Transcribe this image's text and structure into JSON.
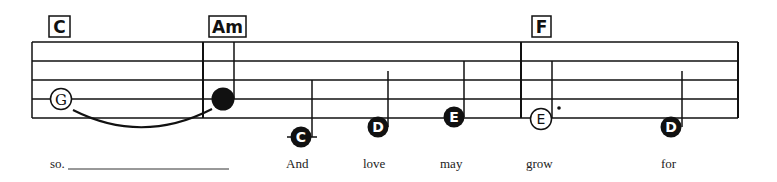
{
  "colors": {
    "ink": "#111111",
    "paper": "#ffffff",
    "lyric": "#222222"
  },
  "staff": {
    "lines": 5,
    "measures": 3
  },
  "chords": [
    {
      "label": "C",
      "measure": 1
    },
    {
      "label": "Am",
      "measure": 2
    },
    {
      "label": "F",
      "measure": 3
    }
  ],
  "notes": [
    {
      "letter": "G",
      "style": "half (hollow)",
      "measure": 1,
      "tied_to_next": true
    },
    {
      "letter": "",
      "style": "quarter (filled)",
      "measure": 2,
      "tied_from_previous": true
    },
    {
      "letter": "C",
      "style": "quarter (filled)",
      "measure": 2,
      "ledger_line": true
    },
    {
      "letter": "D",
      "style": "quarter (filled)",
      "measure": 2
    },
    {
      "letter": "E",
      "style": "quarter (filled)",
      "measure": 2
    },
    {
      "letter": "E",
      "style": "dotted half (hollow)",
      "measure": 3
    },
    {
      "letter": "D",
      "style": "quarter (filled)",
      "measure": 3
    }
  ],
  "lyrics": [
    {
      "text": "so.",
      "extender": true
    },
    {
      "text": "And"
    },
    {
      "text": "love"
    },
    {
      "text": "may"
    },
    {
      "text": "grow"
    },
    {
      "text": "for"
    }
  ]
}
